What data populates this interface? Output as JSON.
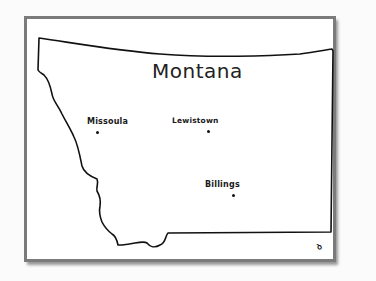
{
  "map": {
    "title": "Montana",
    "cities": [
      {
        "name": "Missoula",
        "x": 97,
        "y": 131
      },
      {
        "name": "Lewistown",
        "x": 208,
        "y": 131
      },
      {
        "name": "Billings",
        "x": 233,
        "y": 196
      }
    ],
    "signature": "ꝺ",
    "colors": {
      "frame_border": "#7d7d7d",
      "outline": "#111111",
      "background": "#ffffff"
    }
  }
}
